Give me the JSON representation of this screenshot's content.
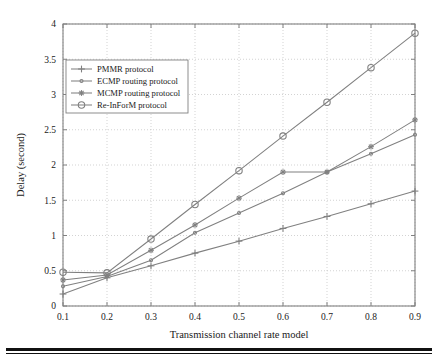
{
  "figure": {
    "background_color": "#ffffff",
    "frame_color": "#808080",
    "grid_color": "#c8c8c8",
    "series_color": "#808080",
    "text_color": "#1a1a1a",
    "rule_color": "#111111"
  },
  "chart_data": {
    "type": "line",
    "title": "",
    "xlabel": "Transmission channel rate model",
    "ylabel": "Delay (second)",
    "x": [
      0.1,
      0.2,
      0.3,
      0.4,
      0.5,
      0.6,
      0.7,
      0.8,
      0.9
    ],
    "xlim": [
      0.1,
      0.9
    ],
    "ylim": [
      0,
      4
    ],
    "xticks": [
      0.1,
      0.2,
      0.3,
      0.4,
      0.5,
      0.6,
      0.7,
      0.8,
      0.9
    ],
    "xtick_labels": [
      "0.1",
      "0.2",
      "0.3",
      "0.4",
      "0.5",
      "0.6",
      "0.7",
      "0.8",
      "0.9"
    ],
    "yticks": [
      0,
      0.5,
      1,
      1.5,
      2,
      2.5,
      3,
      3.5,
      4
    ],
    "ytick_labels": [
      "0",
      "0.5",
      "1",
      "1.5",
      "2",
      "2.5",
      "3",
      "3.5",
      "4"
    ],
    "grid": true,
    "grid_style": "dotted",
    "legend_position": "upper left",
    "series": [
      {
        "name": "PMMR protocol",
        "marker": "plus",
        "values": [
          0.17,
          0.4,
          0.57,
          0.75,
          0.92,
          1.1,
          1.27,
          1.45,
          1.63
        ]
      },
      {
        "name": "ECMP routing protocol",
        "marker": "dot",
        "values": [
          0.28,
          0.42,
          0.65,
          1.04,
          1.32,
          1.6,
          1.9,
          2.16,
          2.43
        ]
      },
      {
        "name": "MCMP routing protocol",
        "marker": "star",
        "values": [
          0.37,
          0.44,
          0.79,
          1.15,
          1.53,
          1.9,
          1.9,
          2.26,
          2.64
        ]
      },
      {
        "name": "Re-InForM protocol",
        "marker": "circle",
        "values": [
          0.48,
          0.47,
          0.95,
          1.44,
          1.92,
          2.41,
          2.89,
          3.38,
          3.87
        ]
      }
    ]
  }
}
